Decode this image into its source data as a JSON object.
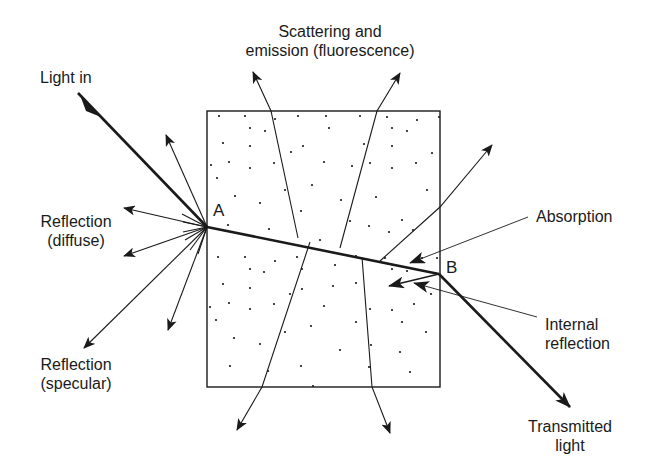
{
  "diagram": {
    "colors": {
      "ink": "#1a1a1a",
      "background": "#ffffff"
    },
    "points": {
      "A": {
        "label": "A",
        "x": 207,
        "y": 227
      },
      "B": {
        "label": "B",
        "x": 439,
        "y": 274
      }
    },
    "labels": {
      "light_in": "Light in",
      "scatter_line1": "Scattering and",
      "scatter_line2": "emission (fluorescence)",
      "refl_diffuse_line1": "Reflection",
      "refl_diffuse_line2": "(diffuse)",
      "refl_specular_line1": "Reflection",
      "refl_specular_line2": "(specular)",
      "absorption": "Absorption",
      "internal_line1": "Internal",
      "internal_line2": "reflection",
      "transmitted_line1": "Transmitted",
      "transmitted_line2": "light"
    },
    "box": {
      "x": 207,
      "y": 111,
      "width": 233,
      "height": 276
    }
  }
}
